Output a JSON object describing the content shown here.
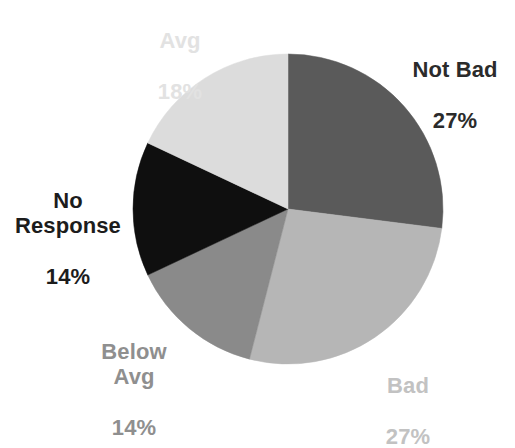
{
  "chart_data": {
    "type": "pie",
    "title": "",
    "subtitle": "",
    "xlabel": "",
    "ylabel": "",
    "legend_position": "none",
    "grid": false,
    "labels_show_name_and_percent": true,
    "start_angle_deg": 0,
    "direction": "clockwise",
    "categories": [
      "Not Bad",
      "Bad",
      "Below Avg",
      "No Response",
      "Avg"
    ],
    "values": [
      27,
      27,
      14,
      14,
      18
    ],
    "value_labels": [
      "27%",
      "27%",
      "14%",
      "14%",
      "18%"
    ],
    "colors": [
      "#5a5a5a",
      "#b6b6b6",
      "#8a8a8a",
      "#0f0f0f",
      "#dcdcdc"
    ],
    "slices": [
      {
        "name": "Not Bad",
        "percent": 27,
        "percent_label": "27%",
        "color": "#5a5a5a",
        "label_color": "#2b2b2b",
        "start_angle_deg": 0,
        "end_angle_deg": 97.2
      },
      {
        "name": "Bad",
        "percent": 27,
        "percent_label": "27%",
        "color": "#b6b6b6",
        "label_color": "#c2c2c2",
        "start_angle_deg": 97.2,
        "end_angle_deg": 194.4
      },
      {
        "name": "Below Avg",
        "percent": 14,
        "percent_label": "14%",
        "color": "#8a8a8a",
        "label_color": "#8f8f8f",
        "start_angle_deg": 194.4,
        "end_angle_deg": 244.8
      },
      {
        "name": "No Response",
        "percent": 14,
        "percent_label": "14%",
        "color": "#0f0f0f",
        "label_color": "#1c1c1c",
        "start_angle_deg": 244.8,
        "end_angle_deg": 295.2
      },
      {
        "name": "Avg",
        "percent": 18,
        "percent_label": "18%",
        "color": "#dcdcdc",
        "label_color": "#e2e2e2",
        "start_angle_deg": 295.2,
        "end_angle_deg": 360
      }
    ],
    "total_percent": 100,
    "geometry": {
      "center_x": 288,
      "center_y": 209,
      "radius": 155
    },
    "background_color": "#ffffff"
  },
  "labels": {
    "not_bad": {
      "name": "Not Bad",
      "percent": "27%"
    },
    "bad": {
      "name": "Bad",
      "percent": "27%"
    },
    "below_avg": {
      "name": "Below\nAvg",
      "percent": "14%"
    },
    "no_response": {
      "name": "No\nResponse",
      "percent": "14%"
    },
    "avg": {
      "name": "Avg",
      "percent": "18%"
    }
  }
}
